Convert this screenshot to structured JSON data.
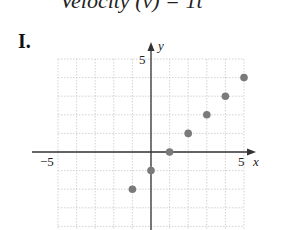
{
  "header": {
    "partial_text": "Velocity (v) = 1t"
  },
  "figure_label": "I.",
  "chart_data": {
    "type": "scatter",
    "title": "",
    "xlabel": "x",
    "ylabel": "y",
    "xlim": [
      -5,
      5
    ],
    "ylim": [
      -4,
      5
    ],
    "x_tick_labels": [
      "-5",
      "5"
    ],
    "y_tick_labels": [
      "5"
    ],
    "grid": true,
    "series": [
      {
        "name": "points",
        "color": "#7a7a7a",
        "x": [
          -1,
          0,
          1,
          2,
          3,
          4,
          5
        ],
        "y": [
          -2,
          -1,
          0,
          1,
          2,
          3,
          4
        ]
      }
    ]
  },
  "labels": {
    "x_min": "−5",
    "x_max": "5",
    "y_max": "5",
    "x_axis": "x",
    "y_axis": "y"
  }
}
